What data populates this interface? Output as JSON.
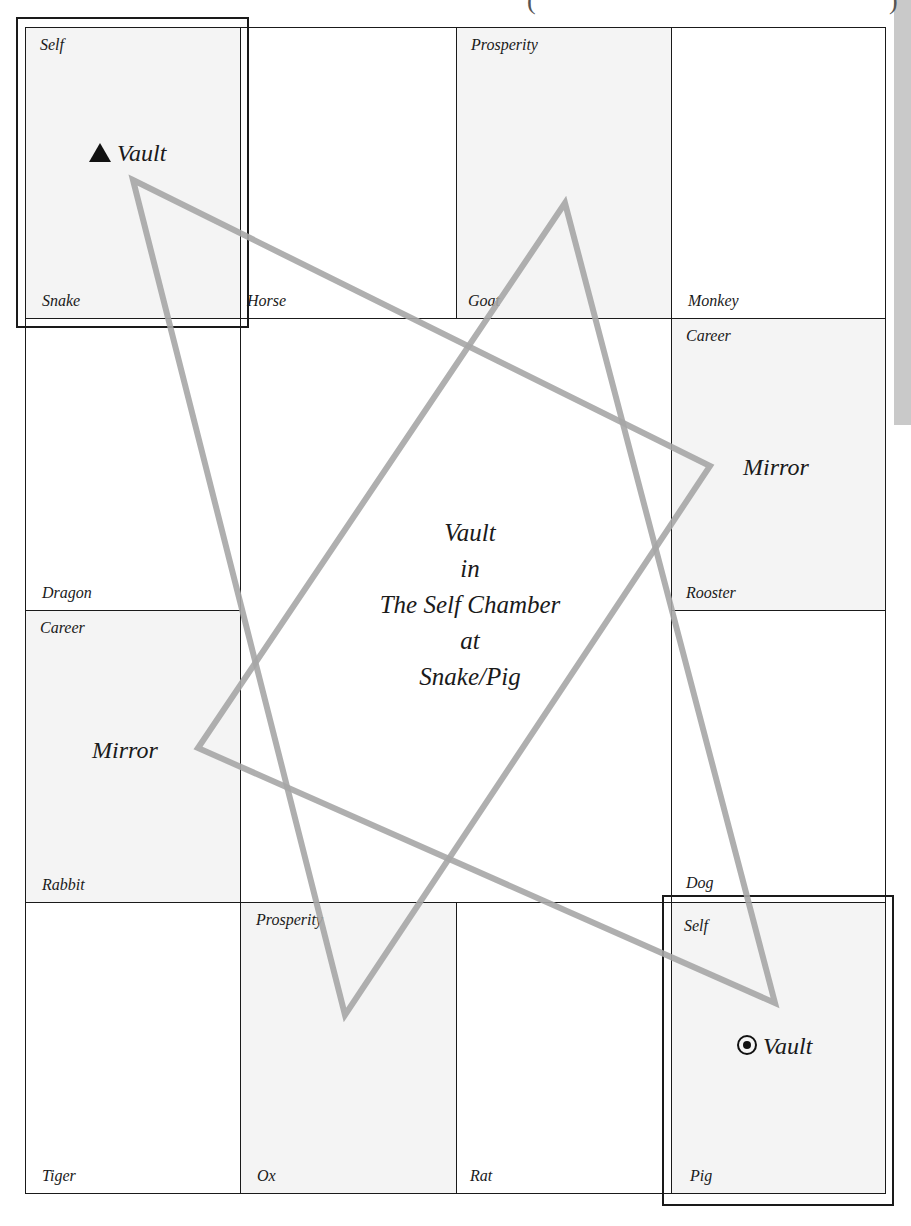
{
  "diagram": {
    "title_center": [
      "Vault",
      "in",
      "The Self Chamber",
      "at",
      "Snake/Pig"
    ],
    "colors": {
      "grid_line": "#1a1a1a",
      "shaded_cell": "#f4f4f4",
      "triangle_stroke": "#a6a6a6",
      "side_strip": "#c9c9c9"
    },
    "cells": {
      "snake": {
        "animal": "Snake",
        "chamber": "Self"
      },
      "horse": {
        "animal": "Horse",
        "chamber": ""
      },
      "goat": {
        "animal": "Goat",
        "chamber": "Prosperity"
      },
      "monkey": {
        "animal": "Monkey",
        "chamber": ""
      },
      "dragon": {
        "animal": "Dragon",
        "chamber": ""
      },
      "rooster": {
        "animal": "Rooster",
        "chamber": "Career"
      },
      "rabbit": {
        "animal": "Rabbit",
        "chamber": "Career"
      },
      "dog": {
        "animal": "Dog",
        "chamber": ""
      },
      "tiger": {
        "animal": "Tiger",
        "chamber": ""
      },
      "ox": {
        "animal": "Ox",
        "chamber": "Prosperity"
      },
      "rat": {
        "animal": "Rat",
        "chamber": ""
      },
      "pig": {
        "animal": "Pig",
        "chamber": "Self"
      }
    },
    "markers": {
      "snake_vault": {
        "symbol": "triangle-icon",
        "label": "Vault"
      },
      "pig_vault": {
        "symbol": "bullseye-icon",
        "label": "Vault"
      },
      "rooster_mirror": {
        "label": "Mirror"
      },
      "rabbit_mirror": {
        "label": "Mirror"
      }
    },
    "triangles": [
      {
        "name": "triangle-a",
        "points": "133,180 710,466 345,1015"
      },
      {
        "name": "triangle-b",
        "points": "565,203 775,1003 198,748"
      }
    ]
  }
}
